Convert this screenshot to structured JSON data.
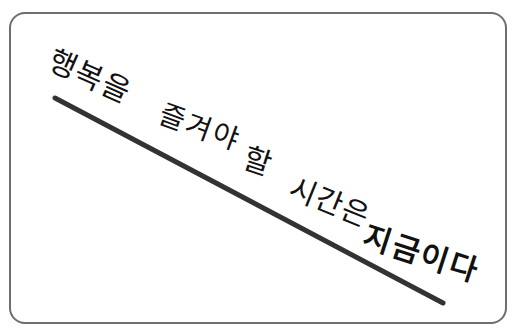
{
  "image": {
    "description": "Korean handwritten calligraphy card",
    "text_full": "행복을 즐겨야 할 시간은 지금이다",
    "words": [
      {
        "text": "행복을"
      },
      {
        "text": "즐겨야"
      },
      {
        "text": "할"
      },
      {
        "text": "시간은"
      },
      {
        "text": "지금이다"
      }
    ],
    "colors": {
      "background": "#ffffff",
      "frame": "#6e6e6e",
      "ink": "#111111",
      "stroke_line": "#333333"
    },
    "stroke_line": {
      "x1": 55,
      "y1": 98,
      "x2": 443,
      "y2": 303
    }
  }
}
